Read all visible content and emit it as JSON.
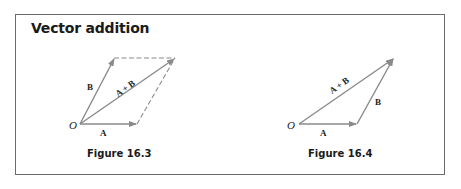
{
  "title": "Vector addition",
  "figures": [
    {
      "caption": "Figure 16.3",
      "origin_label": "O",
      "labels": {
        "a": "A",
        "b": "B",
        "sum": "A + B"
      },
      "style": "parallelogram"
    },
    {
      "caption": "Figure 16.4",
      "origin_label": "O",
      "labels": {
        "a": "A",
        "b": "B",
        "sum": "A + B"
      },
      "style": "triangle"
    }
  ],
  "colors": {
    "vector": "#8a8a8a",
    "border": "#6b6b6b",
    "text": "#1a1a1a"
  }
}
